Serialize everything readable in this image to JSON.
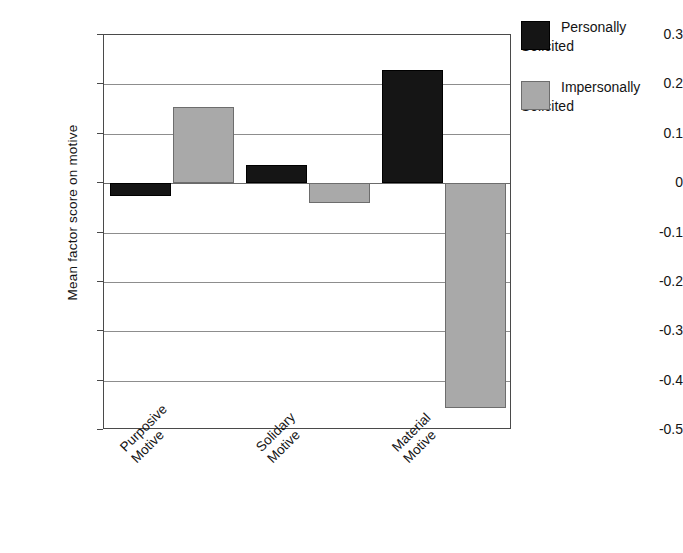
{
  "chart_data": {
    "type": "bar",
    "title": "",
    "xlabel": "",
    "ylabel": "Mean factor score on motive",
    "categories": [
      "Purposive\nMotive",
      "Solidary\nMotive",
      "Material\nMotive"
    ],
    "series": [
      {
        "name": "Personally\nSolicited",
        "color": "#151515",
        "values": [
          -0.027,
          0.037,
          0.23
        ]
      },
      {
        "name": "Impersonally\nSolicited",
        "color": "#a9a9a9",
        "values": [
          0.155,
          -0.04,
          -0.455
        ]
      }
    ],
    "ylim": [
      -0.5,
      0.3
    ],
    "yticks": [
      0.3,
      0.2,
      0.1,
      0,
      -0.1,
      -0.2,
      -0.3,
      -0.4,
      -0.5
    ],
    "ytick_labels": [
      "0.3",
      "0.2",
      "0.1",
      "0",
      "-0.1",
      "-0.2",
      "-0.3",
      "-0.4",
      "-0.5"
    ],
    "grid": true,
    "legend_position": "right-top"
  },
  "legend": {
    "entries": [
      {
        "label": "Personally\nSolicited"
      },
      {
        "label": "Impersonally\nSolicited"
      }
    ]
  }
}
